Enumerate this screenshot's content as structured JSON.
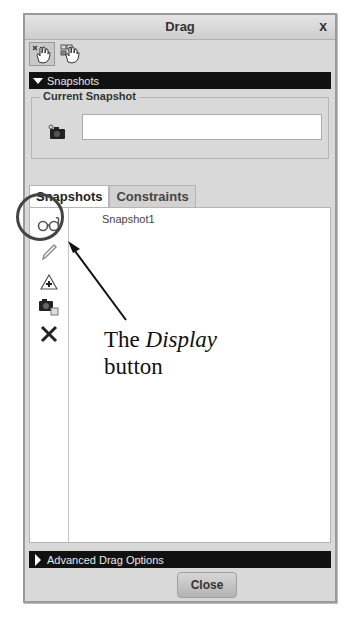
{
  "dialog": {
    "title": "Drag",
    "close_glyph": "x",
    "mode_buttons": [
      {
        "name": "drag-mode-icon",
        "active": true
      },
      {
        "name": "drag-snapshot-mode-icon",
        "active": false
      }
    ],
    "snapshots_section": {
      "label": "Snapshots",
      "expanded": true,
      "current_snapshot": {
        "legend": "Current Snapshot",
        "value": ""
      }
    },
    "tabs": [
      {
        "label": "Snapshots",
        "active": true
      },
      {
        "label": "Constraints",
        "active": false
      }
    ],
    "tools": [
      {
        "name": "display-icon",
        "tooltip": "Display"
      },
      {
        "name": "pencil-icon"
      },
      {
        "name": "explode-icon"
      },
      {
        "name": "camera-copy-icon"
      },
      {
        "name": "delete-icon"
      }
    ],
    "snapshot_list": [
      "Snapshot1"
    ],
    "advanced_section": {
      "label": "Advanced Drag Options",
      "expanded": false
    },
    "close_button": "Close"
  },
  "annotation": {
    "line1_prefix": "The ",
    "line1_emphasis": "Display",
    "line2": "button",
    "color": "#444444"
  }
}
